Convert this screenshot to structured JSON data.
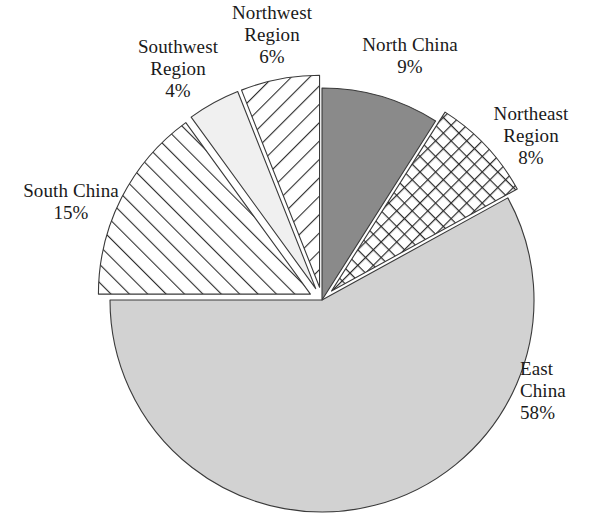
{
  "chart_data": {
    "type": "pie",
    "title": "",
    "subtitle": "",
    "xlabel": "",
    "ylabel": "",
    "legend_position": "none",
    "grid": false,
    "labels_outside": true,
    "units": "percent",
    "total": 100,
    "categories": [
      "North China",
      "Northeast Region",
      "East China",
      "South China",
      "Southwest Region",
      "Northwest Region"
    ],
    "values": [
      9,
      8,
      58,
      15,
      4,
      6
    ],
    "slices": [
      {
        "name": "North China",
        "label_line1": "North China",
        "label_line2": "9%",
        "value": 9,
        "percent_text": "9%",
        "fill_style": "solid-dark-gray",
        "color": "#8a8a8a",
        "exploded": false,
        "start_angle_deg": 0,
        "end_angle_deg": 32.4
      },
      {
        "name": "Northeast Region",
        "label_line1": "Northeast",
        "label_line2": "Region",
        "label_line3": "8%",
        "value": 8,
        "percent_text": "8%",
        "fill_style": "diagonal-crosshatch",
        "color": "#ffffff",
        "exploded": true,
        "start_angle_deg": 32.4,
        "end_angle_deg": 61.2
      },
      {
        "name": "East China",
        "label_line1": "East",
        "label_line2": "China",
        "label_line3": "58%",
        "value": 58,
        "percent_text": "58%",
        "fill_style": "solid-light-gray",
        "color": "#d2d2d2",
        "exploded": false,
        "start_angle_deg": 61.2,
        "end_angle_deg": 270
      },
      {
        "name": "South China",
        "label_line1": "South China",
        "label_line2": "15%",
        "value": 15,
        "percent_text": "15%",
        "fill_style": "forward-diagonal-hatch",
        "color": "#ffffff",
        "exploded": true,
        "start_angle_deg": 270,
        "end_angle_deg": 324
      },
      {
        "name": "Southwest Region",
        "label_line1": "Southwest",
        "label_line2": "Region",
        "label_line3": "4%",
        "value": 4,
        "percent_text": "4%",
        "fill_style": "solid-near-white",
        "color": "#f0f0f0",
        "exploded": true,
        "start_angle_deg": 324,
        "end_angle_deg": 338.4
      },
      {
        "name": "Northwest Region",
        "label_line1": "Northwest",
        "label_line2": "Region",
        "label_line3": "6%",
        "value": 6,
        "percent_text": "6%",
        "fill_style": "backward-diagonal-hatch",
        "color": "#ffffff",
        "exploded": true,
        "start_angle_deg": 338.4,
        "end_angle_deg": 360
      }
    ]
  },
  "labels": {
    "northwest": "Northwest\nRegion\n6%",
    "southwest": "Southwest\nRegion\n4%",
    "north_china": "North China\n9%",
    "northeast": "Northeast\nRegion\n8%",
    "south_china": "South China\n15%",
    "east_china": "East\nChina\n58%"
  },
  "colors": {
    "background": "#ffffff",
    "text": "#1a1a1a",
    "outline": "#3a3a3a",
    "north_china_fill": "#8a8a8a",
    "east_china_fill": "#d2d2d2",
    "southwest_fill": "#f0f0f0",
    "hatch_line": "#2e2e2e"
  }
}
